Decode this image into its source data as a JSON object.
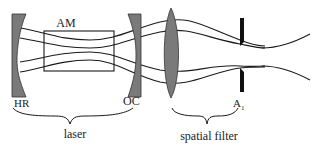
{
  "diagram": {
    "colors": {
      "optic_fill": "#7a7a7a",
      "line": "#1a1a1a",
      "background": "#ffffff"
    },
    "components": {
      "hr_mirror": {
        "label": "HR"
      },
      "gain_medium": {
        "label": "AM"
      },
      "oc_mirror": {
        "label": "OC"
      },
      "lens": {
        "label": ""
      },
      "aperture": {
        "label": "A",
        "subscript": "1"
      }
    },
    "groups": {
      "laser": {
        "label": "laser"
      },
      "spatial_filter": {
        "label": "spatial filter"
      }
    }
  }
}
